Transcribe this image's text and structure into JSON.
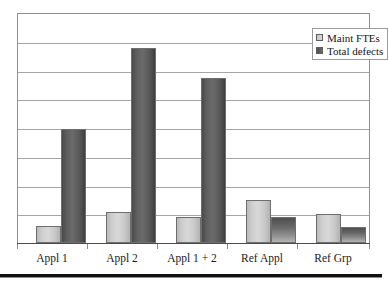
{
  "chart_data": {
    "type": "bar",
    "title": "",
    "subtitle": "",
    "xlabel": "",
    "ylabel": "",
    "categories": [
      "Appl 1",
      "Appl 2",
      "Appl 1 + 2",
      "Ref Appl",
      "Ref Grp"
    ],
    "series": [
      {
        "name": "Maint FTEs",
        "color": "#d0d0d0",
        "values": [
          0.6,
          1.1,
          0.9,
          1.5,
          1.0
        ]
      },
      {
        "name": "Total defects",
        "color": "#5a5a5a",
        "values": [
          4.0,
          6.8,
          5.75,
          0.9,
          0.55
        ]
      }
    ],
    "ylim": [
      0,
      8
    ],
    "yticks": [
      0,
      1,
      2,
      3,
      4,
      5,
      6,
      7,
      8
    ],
    "ytick_labels": [
      "",
      "",
      "",
      "",
      "",
      "",
      "",
      "",
      ""
    ],
    "grid": true,
    "grid_lines": 7,
    "legend_position": "top-right",
    "annotations": []
  },
  "legend": {
    "items": [
      {
        "label": "Maint FTEs",
        "swatch": "legend-swatch-maint-ftes"
      },
      {
        "label": "Total defects",
        "swatch": "legend-swatch-total-defects"
      }
    ]
  },
  "axis": {
    "x_labels": [
      "Appl 1",
      "Appl 2",
      "Appl 1 + 2",
      "Ref Appl",
      "Ref Grp"
    ]
  }
}
